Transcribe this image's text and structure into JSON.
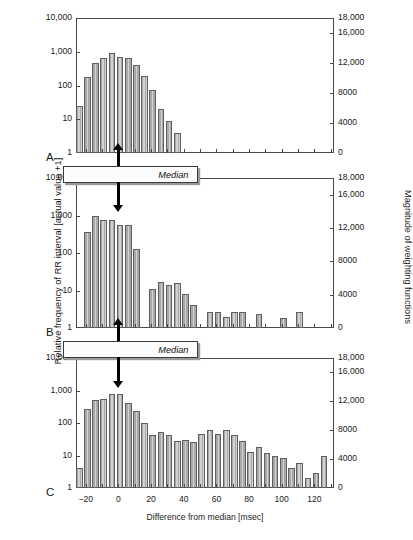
{
  "figure": {
    "xlabel": "Difference from median [msec]",
    "ylabel_left": "Relative frequency of RR interval [actual value +1]",
    "ylabel_right": "Magnitude of weighting functions",
    "median_label": "Median",
    "panel_letters": [
      "A",
      "B",
      "C"
    ],
    "left_ticks": [
      "10,000",
      "1,000",
      "100",
      "10",
      "1"
    ],
    "right_ticks": [
      "18,000",
      "16,000",
      "12,000",
      "8000",
      "4000",
      "0"
    ],
    "x_ticks": [
      "-20",
      "0",
      "20",
      "40",
      "60",
      "80",
      "100",
      "120"
    ]
  },
  "chart_data": [
    {
      "type": "bar",
      "panel": "A",
      "title": "",
      "xlabel": "Difference from median [msec]",
      "ylabel": "Relative frequency of RR interval [actual value +1]",
      "y2label": "Magnitude of weighting functions",
      "yscale": "log",
      "ylim": [
        1,
        10000
      ],
      "y2lim": [
        0,
        18000
      ],
      "xlim": [
        -26,
        132
      ],
      "grid": false,
      "legend": "none",
      "bin_width": 5,
      "x": [
        -24,
        -19,
        -14,
        -9,
        -4,
        1,
        6,
        11,
        16,
        21,
        26,
        31,
        36,
        41,
        46
      ],
      "values": [
        24,
        180,
        450,
        660,
        900,
        680,
        640,
        400,
        190,
        72,
        20,
        9,
        4,
        0,
        0
      ],
      "median_marker_x": 0
    },
    {
      "type": "bar",
      "panel": "B",
      "title": "",
      "xlabel": "Difference from median [msec]",
      "ylabel": "Relative frequency of RR interval [actual value +1]",
      "y2label": "Magnitude of weighting functions",
      "yscale": "log",
      "ylim": [
        1,
        10000
      ],
      "y2lim": [
        0,
        18000
      ],
      "xlim": [
        -26,
        132
      ],
      "grid": false,
      "legend": "none",
      "bin_width": 5,
      "x": [
        -19,
        -14,
        -9,
        -4,
        1,
        6,
        11,
        16,
        21,
        26,
        31,
        36,
        41,
        46,
        51,
        56,
        61,
        66,
        71,
        76,
        81,
        86,
        91,
        96,
        101,
        106,
        111,
        116,
        121,
        126
      ],
      "values": [
        370,
        1000,
        760,
        780,
        560,
        560,
        130,
        0,
        11,
        17,
        14,
        16,
        8,
        4,
        0,
        2.6,
        2.7,
        2.0,
        2.6,
        2.7,
        0,
        2.4,
        0,
        0,
        1.8,
        0,
        2.7,
        0,
        0,
        0
      ],
      "median_marker_x": 0
    },
    {
      "type": "bar",
      "panel": "C",
      "title": "",
      "xlabel": "Difference from median [msec]",
      "ylabel": "Relative frequency of RR interval [actual value +1]",
      "y2label": "Magnitude of weighting functions",
      "yscale": "log",
      "ylim": [
        1,
        10000
      ],
      "y2lim": [
        0,
        18000
      ],
      "xlim": [
        -26,
        132
      ],
      "grid": false,
      "legend": "none",
      "bin_width": 5,
      "x": [
        -24,
        -19,
        -14,
        -9,
        -4,
        1,
        6,
        11,
        16,
        21,
        26,
        31,
        36,
        41,
        46,
        51,
        56,
        61,
        66,
        71,
        76,
        81,
        86,
        91,
        96,
        101,
        106,
        111,
        116,
        121,
        126,
        131
      ],
      "values": [
        4,
        270,
        500,
        540,
        800,
        760,
        420,
        240,
        98,
        42,
        52,
        42,
        27,
        29,
        26,
        47,
        60,
        45,
        60,
        44,
        28,
        13,
        18,
        12,
        9.5,
        8.5,
        4,
        6,
        2,
        3,
        10,
        0
      ],
      "median_marker_x": 0
    }
  ]
}
